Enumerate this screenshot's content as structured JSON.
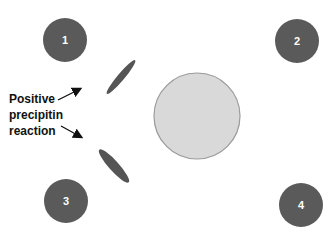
{
  "diagram": {
    "type": "double immunodiffusion (Ouchterlony) plate",
    "center_well": {
      "fill": "#d9d9d9",
      "stroke": "#9a9a9a"
    },
    "outer_wells": [
      {
        "label": "1",
        "color": "#5a5a5a"
      },
      {
        "label": "2",
        "color": "#5a5a5a"
      },
      {
        "label": "3",
        "color": "#5a5a5a"
      },
      {
        "label": "4",
        "color": "#5a5a5a"
      }
    ],
    "precipitin_lines": [
      {
        "between": [
          "center",
          "1"
        ]
      },
      {
        "between": [
          "center",
          "3"
        ]
      }
    ],
    "annotation": {
      "lines": [
        "Positive",
        "precipitin",
        "reaction"
      ]
    }
  }
}
